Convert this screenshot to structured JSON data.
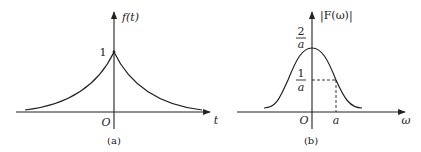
{
  "panel_a": {
    "caption": "(a)",
    "y_axis_label": "f(t)",
    "x_axis_label": "t",
    "origin_label": "O",
    "peak_label": "1",
    "function": "two-sided exponential e^{-a|t|}"
  },
  "panel_b": {
    "caption": "(b)",
    "y_axis_label": "|F(ω)|",
    "x_axis_label": "ω",
    "origin_label": "O",
    "peak_tick": {
      "num": "2",
      "den": "a"
    },
    "half_tick": {
      "num": "1",
      "den": "a"
    },
    "x_tick": "a",
    "function": "2a/(a^2+ω^2)"
  },
  "colors": {
    "stroke": "#222222",
    "background": "#ffffff"
  }
}
